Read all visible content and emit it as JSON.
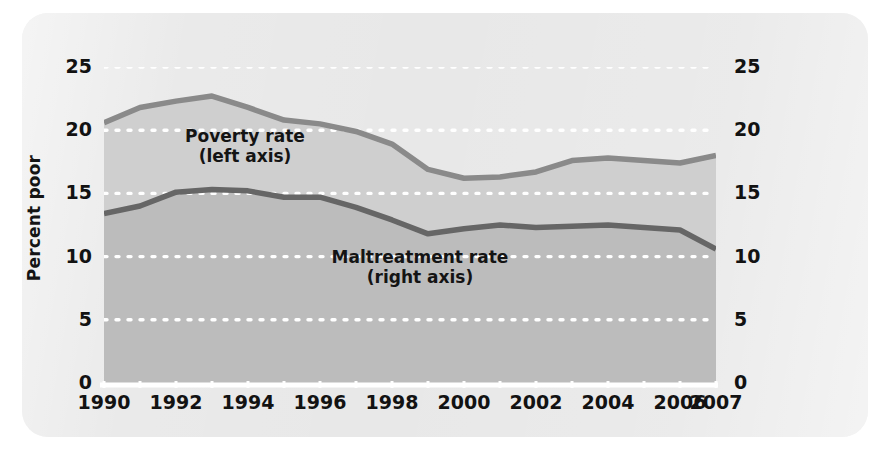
{
  "figure": {
    "background_color": "#e8e8e8",
    "page_color": "#ffffff"
  },
  "axes": {
    "left": {
      "title": "Percent poor",
      "ticks": [
        "0",
        "5",
        "10",
        "15",
        "20",
        "25"
      ],
      "min": 0,
      "max": 25
    },
    "right": {
      "title": "Children maltreated per 1,000 children",
      "ticks": [
        "0",
        "5",
        "10",
        "15",
        "20",
        "25"
      ],
      "min": 0,
      "max": 25
    },
    "bottom": {
      "ticks": [
        "1990",
        "1992",
        "1994",
        "1996",
        "1998",
        "2000",
        "2002",
        "2004",
        "2006",
        "2007"
      ]
    }
  },
  "series_labels": {
    "poverty": "Poverty rate\n(left axis)",
    "maltreatment": "Maltreatment rate\n(right axis)"
  },
  "chart_data": {
    "type": "area",
    "title": "",
    "xlabel": "",
    "ylabel": "Percent poor",
    "y2label": "Children maltreated per 1,000 children",
    "xlim": [
      1990,
      2007
    ],
    "ylim": [
      0,
      25
    ],
    "y2lim": [
      0,
      25
    ],
    "grid": "horizontal dotted white gridlines at 5, 10, 15, 20, 25",
    "legend": "inline labels inside plot area",
    "x": [
      1990,
      1991,
      1992,
      1993,
      1994,
      1995,
      1996,
      1997,
      1998,
      1999,
      2000,
      2001,
      2002,
      2003,
      2004,
      2005,
      2006,
      2007
    ],
    "series": [
      {
        "name": "Poverty rate (left axis)",
        "axis": "left",
        "color": "#8a8a8a",
        "values": [
          20.6,
          21.8,
          22.3,
          22.7,
          21.8,
          20.8,
          20.5,
          19.9,
          18.9,
          16.9,
          16.2,
          16.3,
          16.7,
          17.6,
          17.8,
          17.6,
          17.4,
          18.0
        ]
      },
      {
        "name": "Maltreatment rate (right axis)",
        "axis": "right",
        "color": "#666666",
        "values": [
          13.4,
          14.0,
          15.1,
          15.3,
          15.2,
          14.7,
          14.7,
          13.9,
          12.9,
          11.8,
          12.2,
          12.5,
          12.3,
          12.4,
          12.5,
          12.3,
          12.1,
          10.6
        ]
      }
    ]
  }
}
